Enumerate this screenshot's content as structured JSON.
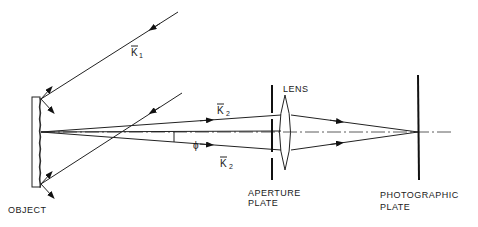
{
  "diagram": {
    "type": "optical setup schematic",
    "labels": {
      "object": "OBJECT",
      "lens": "LENS",
      "aperture_line1": "APERTURE",
      "aperture_line2": "PLATE",
      "photo_line1": "PHOTOGRAPHIC",
      "photo_line2": "PLATE",
      "k1": "K",
      "k1_sub": "1",
      "k2_upper": "K",
      "k2_upper_sub": "2",
      "k2_lower": "K",
      "k2_lower_sub": "2",
      "phi": "ϕ"
    },
    "components": [
      "object",
      "aperture plate",
      "lens",
      "photographic plate"
    ],
    "rays": [
      "incident K1 (upper)",
      "incident (lower)",
      "diffracted K2 upper",
      "diffracted K2 lower"
    ],
    "colors": {
      "ink": "#1a1a1a",
      "background": "#ffffff"
    }
  }
}
